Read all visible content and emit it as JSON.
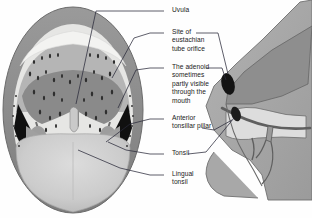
{
  "figure": {
    "view_left": "open-mouth-anterior-view",
    "view_right": "sagittal-head-profile"
  },
  "labels": [
    {
      "id": "uvula",
      "text": "Uvula",
      "x": 168,
      "y": 9
    },
    {
      "id": "eustachian",
      "text": "Site of\neustachian\ntube orifice",
      "x": 168,
      "y": 31
    },
    {
      "id": "adenoid",
      "text": "The adenoid\nsometimes\npartly visible\nthrough the\nmouth",
      "x": 168,
      "y": 66
    },
    {
      "id": "anterior-pillar",
      "text": "Anterior\ntonsillar pillar",
      "x": 168,
      "y": 117
    },
    {
      "id": "tonsil",
      "text": "Tonsil",
      "x": 168,
      "y": 152
    },
    {
      "id": "lingual-tonsil",
      "text": "Lingual\ntonsil",
      "x": 168,
      "y": 172
    }
  ],
  "colors": {
    "lip": "#8e8e8e",
    "lip_dark": "#7a7a7a",
    "teeth": "#f2f2f0",
    "palate": "#b7b7b7",
    "mucosa": "#a5a5a5",
    "fossa_dark": "#141414",
    "tongue": "#cfcfcf",
    "tongue_shadow": "#bdbdbd",
    "skin": "#a8a8a8",
    "nasal": "#999999",
    "cavity_light": "#e2e2e0",
    "leader": "#2a2a3a",
    "text": "#1a1a1a",
    "background": "#fefefe"
  }
}
